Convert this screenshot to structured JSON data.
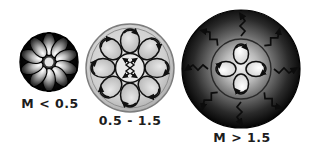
{
  "figure": {
    "type": "diagram",
    "background_color": "#ffffff",
    "label_color": "#1c1c1c"
  },
  "panels": [
    {
      "id": "low-mass",
      "label": "M < 0.5",
      "label_position": "below",
      "cx": 49,
      "cy": 62,
      "r": 29,
      "fill": "dark",
      "fill_color": "#0a0a0a",
      "rim_color": "#0d0d0d",
      "structure": "fully-convective",
      "petal_count": 10,
      "petal_color": "#d8d8d8",
      "has_inner_core": false,
      "has_radiative_arrows": false,
      "cell_count": 10,
      "description": "fully convective star: light radial petal-shaped convection cells filling the entire dark sphere"
    },
    {
      "id": "mid-mass",
      "label": "0.5 - 1.5",
      "label_position": "below",
      "cx": 130,
      "cy": 68,
      "r": 44,
      "fill": "light",
      "fill_color": "#d5d5d5",
      "rim_color": "#8a8a8a",
      "structure": "radiative-core-convective-envelope",
      "cell_count": 8,
      "cell_fill": "#c8c8c8",
      "cell_stroke": "#141414",
      "core_radius": 15,
      "core_fill": "#e2e2e2",
      "core_arrow_count": 4,
      "has_inner_core": true,
      "has_radiative_arrows": false,
      "description": "radiative core with small outward arrows surrounded by eight circulating convection cells with arrowheads"
    },
    {
      "id": "high-mass",
      "label": "M > 1.5",
      "label_position": "below",
      "cx": 241,
      "cy": 69,
      "r": 59,
      "fill": "dark-gradient",
      "fill_color": "#0c0c0c",
      "gradient_inner": "#f2f2f2",
      "gradient_outer": "#050505",
      "rim_color": "#050505",
      "structure": "convective-core-radiative-envelope",
      "core_radius": 30,
      "core_fill": "#e8e8e8",
      "core_stroke": "#1a1a1a",
      "cell_count": 4,
      "cell_fill": "#f4f4f4",
      "cell_stroke": "#101010",
      "radiative_arrow_count": 8,
      "radiative_arrow_color": "#101010",
      "has_inner_core": true,
      "has_radiative_arrows": true,
      "description": "convective core of four circulating cells surrounded by a radiative envelope with zigzag photon arrows radiating outward"
    }
  ]
}
